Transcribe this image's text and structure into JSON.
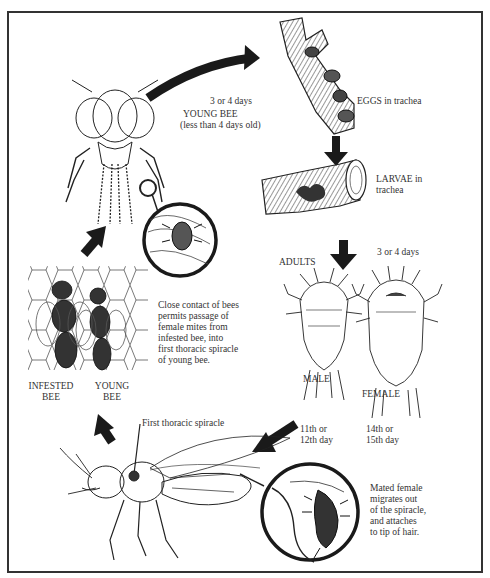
{
  "diagram": {
    "type": "life-cycle",
    "stages": [
      {
        "id": "young-bee",
        "label": "YOUNG BEE",
        "sublabel": "(less than 4 days old)"
      },
      {
        "id": "eggs",
        "label": "EGGS in trachea"
      },
      {
        "id": "larvae",
        "label_line1": "LARVAE in",
        "label_line2": "trachea"
      },
      {
        "id": "adults",
        "label": "ADULTS",
        "male": "MALE",
        "female": "FEMALE"
      },
      {
        "id": "migration",
        "text_lines": [
          "Mated female",
          "migrates out",
          "of the spiracle,",
          "and attaches",
          "to tip of hair."
        ]
      },
      {
        "id": "transfer",
        "text_lines": [
          "Close contact of bees",
          "permits passage of",
          "female mites from",
          "infested bee, into",
          "first thoracic spiracle",
          "of young bee."
        ]
      }
    ],
    "arrows": [
      {
        "from": "young-bee",
        "to": "eggs",
        "label": "3 or 4 days"
      },
      {
        "from": "eggs",
        "to": "larvae",
        "label": ""
      },
      {
        "from": "larvae",
        "to": "adults",
        "label": "3 or 4 days"
      },
      {
        "from": "adults-male",
        "to": "spiracle-bee",
        "label_line1": "11th or",
        "label_line2": "12th day"
      },
      {
        "from": "adults-female",
        "to": "spiracle-bee",
        "label_line1": "14th  or",
        "label_line2": "15th  day"
      },
      {
        "from": "spiracle-bee",
        "to": "bees-contact",
        "label": ""
      },
      {
        "from": "bees-contact",
        "to": "young-bee",
        "label": ""
      }
    ],
    "contact_labels": {
      "infested_line1": "INFESTED",
      "infested_line2": "BEE",
      "young_line1": "YOUNG",
      "young_line2": "BEE"
    },
    "spiracle_label": "First thoracic spiracle",
    "colors": {
      "ink": "#222222",
      "frame": "#333333",
      "background": "#ffffff"
    }
  }
}
